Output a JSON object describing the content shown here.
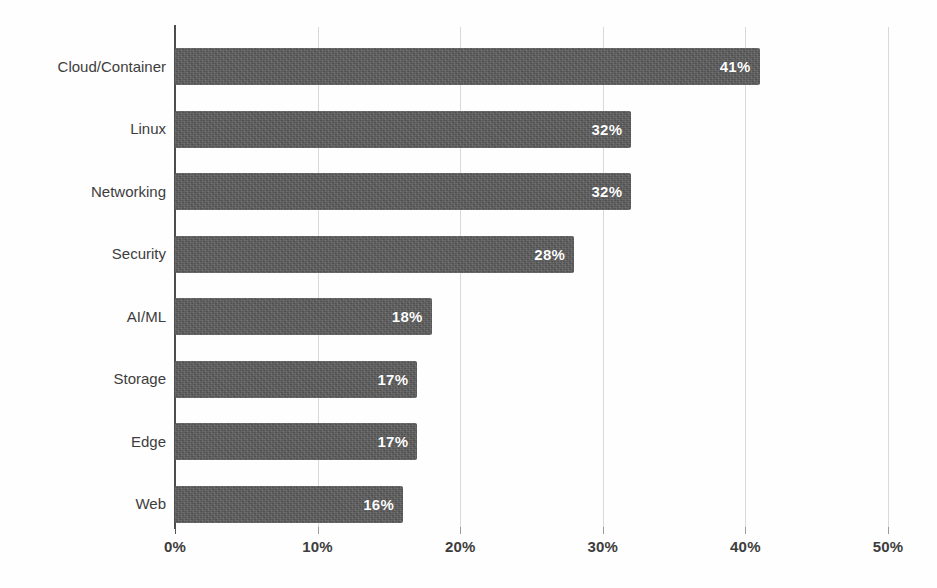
{
  "chart_data": {
    "type": "bar",
    "orientation": "horizontal",
    "title": "",
    "xlabel": "",
    "ylabel": "",
    "categories": [
      "Cloud/Container",
      "Linux",
      "Networking",
      "Security",
      "AI/ML",
      "Storage",
      "Edge",
      "Web"
    ],
    "values": [
      41,
      32,
      32,
      28,
      18,
      17,
      17,
      16
    ],
    "value_labels": [
      "41%",
      "32%",
      "32%",
      "28%",
      "18%",
      "17%",
      "17%",
      "16%"
    ],
    "xlim": [
      0,
      50
    ],
    "xticks": [
      0,
      10,
      20,
      30,
      40,
      50
    ],
    "xtick_labels": [
      "0%",
      "10%",
      "20%",
      "30%",
      "40%",
      "50%"
    ],
    "grid": true,
    "grid_axis": "x",
    "legend": false,
    "bar_color": "#5c5c5c",
    "grid_color": "#d9d9d9",
    "axis_color": "#4d4d4d",
    "label_color": "#3d3d3d",
    "value_label_color": "#ffffff",
    "background": "#fefefe"
  }
}
